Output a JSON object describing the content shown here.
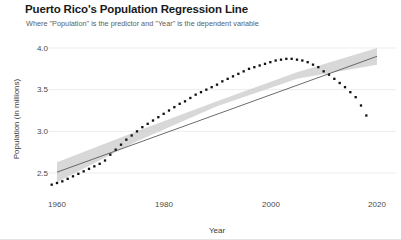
{
  "chart_data": {
    "type": "scatter",
    "title": "Puerto Rico's Population Regression Line",
    "subtitle": "Where \"Population\" is the predictor and \"Year\" is the dependent variable",
    "xlabel": "Year",
    "ylabel": "Population (in millions)",
    "xlim": [
      1957,
      2021
    ],
    "ylim": [
      2.28,
      4.05
    ],
    "xticks": [
      1960,
      1980,
      2000,
      2020
    ],
    "xtick_labels": [
      "1960",
      "1980",
      "2000",
      "2020"
    ],
    "yticks": [
      2.5,
      3.0,
      3.5,
      4.0
    ],
    "ytick_labels": [
      "2.5",
      "3.0",
      "3.5",
      "4.0"
    ],
    "grid": true,
    "grid_axis": "y",
    "legend": "none",
    "series": [
      {
        "name": "Population (observed)",
        "type": "scatter",
        "marker": "square-dot",
        "color": "#111111",
        "x": [
          1959,
          1960,
          1961,
          1962,
          1963,
          1964,
          1965,
          1966,
          1967,
          1968,
          1969,
          1970,
          1971,
          1972,
          1973,
          1974,
          1975,
          1976,
          1977,
          1978,
          1979,
          1980,
          1981,
          1982,
          1983,
          1984,
          1985,
          1986,
          1987,
          1988,
          1989,
          1990,
          1991,
          1992,
          1993,
          1994,
          1995,
          1996,
          1997,
          1998,
          1999,
          2000,
          2001,
          2002,
          2003,
          2004,
          2005,
          2006,
          2007,
          2008,
          2009,
          2010,
          2011,
          2012,
          2013,
          2014,
          2015,
          2016,
          2017,
          2018
        ],
        "y": [
          2.36,
          2.38,
          2.4,
          2.43,
          2.46,
          2.49,
          2.52,
          2.55,
          2.58,
          2.61,
          2.65,
          2.72,
          2.78,
          2.84,
          2.9,
          2.95,
          3.0,
          3.05,
          3.09,
          3.13,
          3.17,
          3.21,
          3.25,
          3.29,
          3.33,
          3.36,
          3.4,
          3.44,
          3.47,
          3.5,
          3.53,
          3.56,
          3.6,
          3.63,
          3.66,
          3.69,
          3.72,
          3.75,
          3.77,
          3.79,
          3.81,
          3.83,
          3.85,
          3.86,
          3.87,
          3.87,
          3.86,
          3.85,
          3.83,
          3.8,
          3.77,
          3.72,
          3.68,
          3.63,
          3.58,
          3.53,
          3.47,
          3.41,
          3.31,
          3.19
        ]
      },
      {
        "name": "Regression line",
        "type": "line",
        "color": "#5a5a5a",
        "x": [
          1960,
          2020
        ],
        "y": [
          2.51,
          3.9
        ]
      },
      {
        "name": "Confidence band",
        "type": "band",
        "color": "#c9c9c9",
        "x": [
          1960,
          1975,
          1990,
          2005,
          2020
        ],
        "y_upper": [
          2.63,
          3.0,
          3.36,
          3.71,
          4.0
        ],
        "y_lower": [
          2.39,
          2.88,
          3.3,
          3.63,
          3.8
        ]
      }
    ]
  },
  "figure": {
    "title": "Puerto Rico's Population Regression Line",
    "subtitle": "Where \"Population\" is the predictor and \"Year\" is the dependent variable",
    "xlabel": "Year",
    "ylabel": "Population (in millions)",
    "xtick_labels": [
      "1960",
      "1980",
      "2000",
      "2020"
    ],
    "ytick_labels": [
      "2.5",
      "3.0",
      "3.5",
      "4.0"
    ],
    "colors": {
      "point": "#111111",
      "line": "#5a5a5a",
      "band": "#c9c9c9",
      "grid": "#ededed",
      "background": "#ffffff",
      "title": "#1a1a1a",
      "subtitle": "#5e5e5e"
    }
  }
}
